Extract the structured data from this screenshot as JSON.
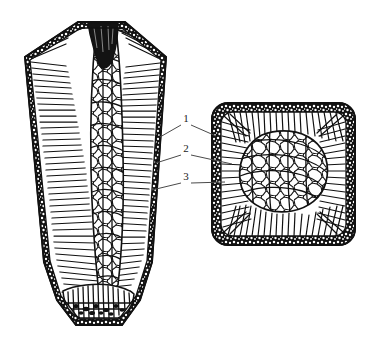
{
  "figure": {
    "background_color": "#ffffff",
    "ink_color": "#101010",
    "line_color": "#4a4a4a"
  },
  "views": {
    "longitudinal": {
      "name": "longitudinal-section",
      "description": "Tapered ingot longitudinal section with shrinkage pipe at top and sediment cone at bottom"
    },
    "transverse": {
      "name": "transverse-section",
      "description": "Square rounded-corner transverse section showing concentric solidification zones"
    }
  },
  "callouts": [
    {
      "id": "callout-1",
      "label": "1",
      "label_x": 186,
      "label_y": 122,
      "left_target_x": 160,
      "left_target_y": 137,
      "right_target_x": 216,
      "right_target_y": 136,
      "meaning": "chill-zone"
    },
    {
      "id": "callout-2",
      "label": "2",
      "label_x": 186,
      "label_y": 152,
      "left_target_x": 156,
      "left_target_y": 163,
      "right_target_x": 232,
      "right_target_y": 164,
      "meaning": "columnar-zone"
    },
    {
      "id": "callout-3",
      "label": "3",
      "label_x": 186,
      "label_y": 180,
      "left_target_x": 152,
      "left_target_y": 190,
      "right_target_x": 225,
      "right_target_y": 182,
      "meaning": "equiaxed-zone"
    }
  ]
}
